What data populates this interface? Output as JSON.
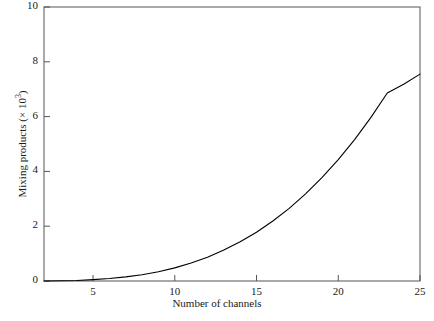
{
  "chart_data": {
    "type": "line",
    "title": "",
    "subtitle": "",
    "xlabel": "Number of channels",
    "ylabel_prefix": "Mixing products (× 10",
    "ylabel_exponent": "3",
    "ylabel_suffix": ")",
    "ylabel": "Mixing products (× 10³)",
    "xlim": [
      2,
      25
    ],
    "ylim": [
      0,
      10
    ],
    "xticks": [
      5,
      10,
      15,
      20,
      25
    ],
    "xtick_labels": [
      "5",
      "10",
      "15",
      "20",
      "25"
    ],
    "yticks": [
      0,
      2,
      4,
      6,
      8,
      10
    ],
    "ytick_labels": [
      "0",
      "2",
      "4",
      "6",
      "8",
      "10"
    ],
    "grid": false,
    "legend": false,
    "legend_position": "none",
    "line_color": "#000000",
    "line_width": 1.1,
    "frame_color": "#555555",
    "background": "#ffffff",
    "series": [
      {
        "name": "Mixing products",
        "x": [
          2,
          3,
          4,
          5,
          6,
          7,
          8,
          9,
          10,
          11,
          12,
          13,
          14,
          15,
          16,
          17,
          18,
          19,
          20,
          21,
          22,
          23,
          24,
          25
        ],
        "values": [
          0.0,
          0.01,
          0.02,
          0.05,
          0.09,
          0.15,
          0.23,
          0.34,
          0.48,
          0.66,
          0.87,
          1.13,
          1.43,
          1.78,
          2.19,
          2.65,
          3.18,
          3.77,
          4.43,
          5.16,
          5.97,
          6.86,
          7.18,
          7.55
        ]
      }
    ],
    "annotations": []
  }
}
